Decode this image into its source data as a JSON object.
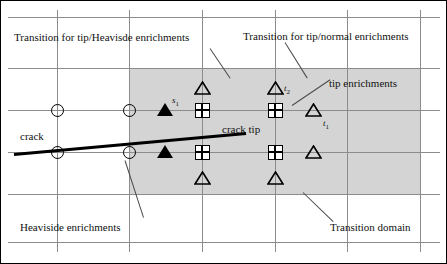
{
  "figure": {
    "type": "technical-diagram",
    "background_color": "#ffffff",
    "shade_color": "#d4d4d4",
    "grid_color": "#8c8c8c",
    "ink_color": "#000000"
  },
  "labels": {
    "transition_tip_heaviside": "Transition for tip/Heavisde enrichments",
    "transition_tip_normal": "Transition for tip/normal enrichments",
    "tip_enrichments": "tip enrichments",
    "crack": "crack",
    "crack_tip": "crack tip",
    "heaviside_enrichments": "Heaviside enrichments",
    "transition_domain": "Transition domain"
  },
  "node_labels": {
    "s1": "s",
    "s1_sub": "1",
    "t1": "t",
    "t1_sub": "1",
    "t2": "t",
    "t2_sub": "2"
  },
  "grid": {
    "vertical_x": [
      57,
      129,
      202,
      275,
      347,
      420
    ],
    "horizontal_y": [
      17,
      68,
      110,
      152,
      194,
      242
    ],
    "v_top": 10,
    "v_bottom": 252,
    "h_left": 8,
    "h_right": 440
  },
  "transition_domain_rect": {
    "x": 129,
    "y": 68,
    "width": 291,
    "height": 126
  },
  "crack": {
    "x1": 14,
    "y1": 154,
    "x2": 246,
    "y2": 133,
    "thickness": 3
  },
  "nodes": [
    {
      "kind": "circle",
      "x": 57,
      "y": 110,
      "name": "node-circle-r1-c1"
    },
    {
      "kind": "circle",
      "x": 129,
      "y": 110,
      "name": "node-circle-r1-c2"
    },
    {
      "kind": "triangle-solid",
      "x": 165,
      "y": 110,
      "name": "node-solid-triangle-s1"
    },
    {
      "kind": "square-cross",
      "x": 202,
      "y": 110,
      "name": "node-square-r1-c3"
    },
    {
      "kind": "square-cross",
      "x": 275,
      "y": 110,
      "name": "node-square-r1-c4"
    },
    {
      "kind": "triangle-open",
      "x": 313,
      "y": 110,
      "name": "node-open-triangle-t1"
    },
    {
      "kind": "triangle-open",
      "x": 202,
      "y": 88,
      "name": "node-open-triangle-upper-c3"
    },
    {
      "kind": "triangle-open",
      "x": 275,
      "y": 88,
      "name": "node-open-triangle-t2"
    },
    {
      "kind": "circle",
      "x": 57,
      "y": 152,
      "name": "node-circle-r2-c1"
    },
    {
      "kind": "circle",
      "x": 129,
      "y": 152,
      "name": "node-circle-r2-c2"
    },
    {
      "kind": "triangle-solid",
      "x": 165,
      "y": 152,
      "name": "node-solid-triangle-r2"
    },
    {
      "kind": "square-cross",
      "x": 202,
      "y": 152,
      "name": "node-square-r2-c3"
    },
    {
      "kind": "square-cross",
      "x": 275,
      "y": 152,
      "name": "node-square-r2-c4"
    },
    {
      "kind": "triangle-open",
      "x": 313,
      "y": 152,
      "name": "node-open-triangle-r2"
    },
    {
      "kind": "triangle-open",
      "x": 202,
      "y": 178,
      "name": "node-open-triangle-lower-c3"
    },
    {
      "kind": "triangle-open",
      "x": 275,
      "y": 178,
      "name": "node-open-triangle-lower-c4"
    }
  ],
  "legend_meaning": {
    "circle": "standard / normal node",
    "triangle-solid": "transition node s1",
    "square-cross": "tip enrichment node",
    "triangle-open": "tip enrichment node t"
  }
}
